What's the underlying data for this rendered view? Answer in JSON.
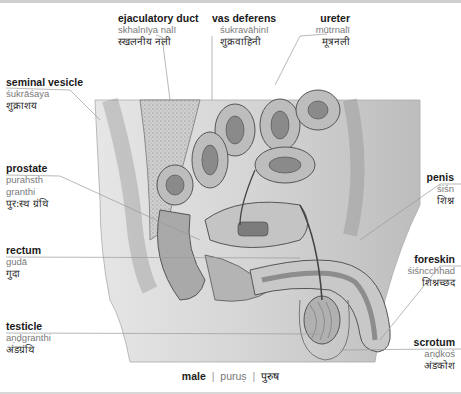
{
  "caption": {
    "english": "male",
    "separator": "|",
    "transliteration": "puruṣ",
    "hindi": "पुरुष"
  },
  "labels": [
    {
      "id": "ejaculatory-duct",
      "english": "ejaculatory duct",
      "transliteration": "skhalnīya nalī",
      "hindi": "स्खलनीय नली"
    },
    {
      "id": "vas-deferens",
      "english": "vas deferens",
      "transliteration": "śukravāhinī",
      "hindi": "शुक्रवाहिनी"
    },
    {
      "id": "ureter",
      "english": "ureter",
      "transliteration": "mūtrnalī",
      "hindi": "मूत्रनली"
    },
    {
      "id": "seminal-vesicle",
      "english": "seminal vesicle",
      "transliteration": "śukrāśaya",
      "hindi": "शुक्राशय"
    },
    {
      "id": "prostate",
      "english": "prostate",
      "transliteration": "purahsth granthi",
      "transliteration_line1": "purahsth",
      "transliteration_line2": "granthi",
      "hindi": "पुर:स्थ ग्रंथि"
    },
    {
      "id": "penis",
      "english": "penis",
      "transliteration": "śiśn",
      "hindi": "शिश्न"
    },
    {
      "id": "rectum",
      "english": "rectum",
      "transliteration": "gudā",
      "hindi": "गुदा"
    },
    {
      "id": "foreskin",
      "english": "foreskin",
      "transliteration": "śiśncchhad",
      "hindi": "शिश्नच्छद"
    },
    {
      "id": "testicle",
      "english": "testicle",
      "transliteration": "aṇḍgranthi",
      "hindi": "अंडग्रंथि"
    },
    {
      "id": "scrotum",
      "english": "scrotum",
      "transliteration": "aṇḍkoś",
      "hindi": "अंडकोश"
    }
  ]
}
